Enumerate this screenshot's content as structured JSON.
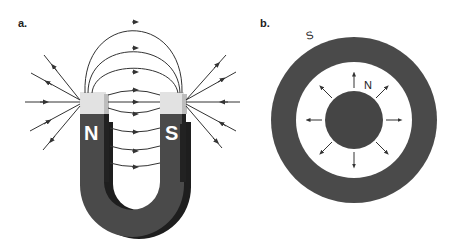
{
  "panel_a": {
    "label": "a.",
    "north_pole": "N",
    "south_pole": "S",
    "description": "horseshoe magnet with field lines from N to S"
  },
  "panel_b": {
    "label": "b.",
    "outer_pole": "S",
    "inner_pole": "N",
    "description": "concentric ring magnet with radial field arrows from inner N outward"
  },
  "colors": {
    "magnet_body": "#4a4a4a",
    "magnet_dark": "#2a2a2a",
    "pole_cap": "#e0e0e0",
    "field_line": "#333333",
    "background": "#ffffff"
  }
}
